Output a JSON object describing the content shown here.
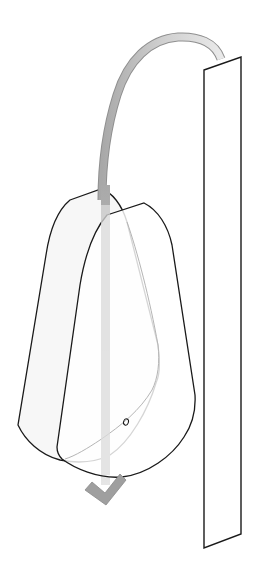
{
  "diagram": {
    "type": "assembly-instruction",
    "colors": {
      "background": "#ffffff",
      "outline": "#1a1a1a",
      "hidden_edge": "#b0b0b0",
      "arrow_dark": "#9a9a9a",
      "arrow_light": "#e4e4e4",
      "shell_fill": "#f7f7f7"
    },
    "elements": [
      {
        "id": "wall-panel",
        "label": ""
      },
      {
        "id": "back-shell",
        "label": ""
      },
      {
        "id": "front-shell",
        "label": ""
      },
      {
        "id": "screw-hole",
        "label": ""
      },
      {
        "id": "motion-arrow",
        "label": ""
      }
    ]
  }
}
